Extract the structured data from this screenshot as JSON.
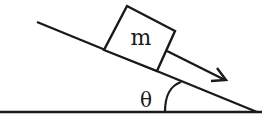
{
  "diagram": {
    "mass_label": "m",
    "angle_label": "θ",
    "elements": {
      "incline": {
        "x1": 37,
        "y1": 22,
        "x2": 256,
        "y2": 112
      },
      "ground": {
        "x1": 0,
        "y1": 112,
        "x2": 262,
        "y2": 112
      },
      "block": {
        "corners": [
          [
            127,
            6
          ],
          [
            175,
            31
          ],
          [
            157,
            71
          ],
          [
            104,
            50
          ]
        ]
      },
      "arrow": {
        "from": [
          167,
          52
        ],
        "to": [
          226,
          80
        ],
        "meaning": "direction of motion down the incline"
      },
      "angle_arc": {
        "at_vertex": "ground-incline intersection"
      }
    },
    "stroke_color": "#1a1a1a",
    "background": "#ffffff"
  }
}
